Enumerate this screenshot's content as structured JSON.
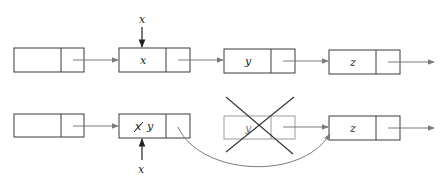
{
  "diagram": {
    "colors": {
      "box_stroke": "#3a3a3a",
      "faded_box_stroke": "#9a9a9a",
      "arrow": "#7a7a7a",
      "cross": "#333333",
      "text": "#222222"
    },
    "rows": [
      {
        "name": "before",
        "nodes": [
          {
            "id": "n1",
            "value": ""
          },
          {
            "id": "n2",
            "value": "x"
          },
          {
            "id": "n3",
            "value": "y"
          },
          {
            "id": "n4",
            "value": "z"
          }
        ],
        "pointer": {
          "label": "x",
          "target": "n2",
          "position": "above"
        }
      },
      {
        "name": "after",
        "nodes": [
          {
            "id": "m1",
            "value": ""
          },
          {
            "id": "m2",
            "value_struck": "x",
            "value": "y"
          },
          {
            "id": "m3",
            "value": "y",
            "deleted": true
          },
          {
            "id": "m4",
            "value": "z"
          }
        ],
        "pointer": {
          "label": "x",
          "target": "m2",
          "position": "below"
        },
        "bypass_arrow": {
          "from": "m2",
          "to": "m4"
        }
      }
    ]
  }
}
